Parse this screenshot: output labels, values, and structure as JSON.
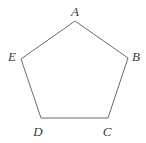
{
  "figure": {
    "type": "polygon",
    "shape_name": "pentagon",
    "sides": 5,
    "stroke_color": "#6b6b6b",
    "stroke_width": 1,
    "fill_color": "none",
    "background_color": "#ffffff",
    "label_color": "#3a3a3a",
    "canvas": {
      "width": 146,
      "height": 143
    },
    "vertices": [
      {
        "label": "A",
        "x": 75,
        "y": 21,
        "label_x": 75,
        "label_y": 11
      },
      {
        "label": "B",
        "x": 128,
        "y": 58,
        "label_x": 136,
        "label_y": 56
      },
      {
        "label": "C",
        "x": 108,
        "y": 118,
        "label_x": 107,
        "label_y": 131
      },
      {
        "label": "D",
        "x": 41,
        "y": 118,
        "label_x": 38,
        "label_y": 131
      },
      {
        "label": "E",
        "x": 21,
        "y": 59,
        "label_x": 12,
        "label_y": 56
      }
    ]
  }
}
